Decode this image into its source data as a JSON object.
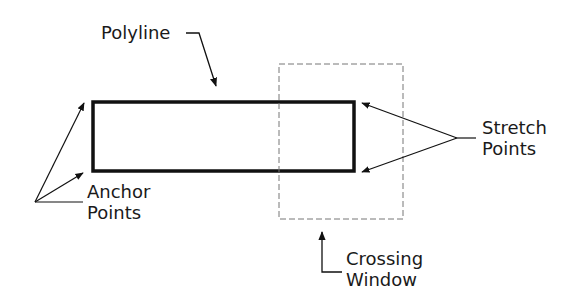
{
  "labels": {
    "polyline": "Polyline",
    "stretch_line1": "Stretch",
    "stretch_line2": "Points",
    "anchor_line1": "Anchor",
    "anchor_line2": "Points",
    "crossing_line1": "Crossing",
    "crossing_line2": "Window"
  },
  "colors": {
    "stroke": "#111111",
    "dashed": "#777777",
    "background": "#ffffff"
  }
}
